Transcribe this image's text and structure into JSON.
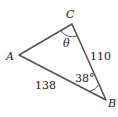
{
  "diagram": {
    "type": "triangle",
    "vertices": [
      {
        "label": "A",
        "x": 19,
        "y": 55
      },
      {
        "label": "B",
        "x": 106,
        "y": 100
      },
      {
        "label": "C",
        "x": 72,
        "y": 24
      }
    ],
    "sides": [
      {
        "between": "C-B",
        "label": "110"
      },
      {
        "between": "A-B",
        "label": "138"
      }
    ],
    "angles": [
      {
        "at": "C",
        "label": "θ"
      },
      {
        "at": "B",
        "label": "38°"
      }
    ],
    "colors": {
      "stroke": "#555555",
      "text": "#222222",
      "background": "#ffffff"
    }
  }
}
